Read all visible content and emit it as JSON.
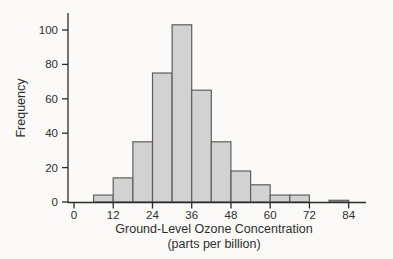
{
  "figure": {
    "background": "#fbfaf8"
  },
  "chart_data": {
    "type": "bar",
    "subtype": "histogram",
    "title": "",
    "ylabel": "Frequency",
    "xlabel": "Ground-Level Ozone Concentration",
    "xlabel_line2": "(parts per billion)",
    "bin_start": 6,
    "bin_width": 6,
    "bin_edges": [
      6,
      12,
      18,
      24,
      30,
      36,
      42,
      48,
      54,
      60,
      66,
      72,
      78,
      84
    ],
    "frequencies": [
      4,
      14,
      35,
      75,
      103,
      65,
      35,
      18,
      10,
      4,
      4,
      0,
      1
    ],
    "x_ticks": [
      0,
      12,
      24,
      36,
      48,
      60,
      72,
      84
    ],
    "y_ticks": [
      0,
      20,
      40,
      60,
      80,
      100
    ],
    "xlim": [
      0,
      90
    ],
    "ylim": [
      0,
      110
    ],
    "grid": false,
    "legend": "none",
    "bar_fill": "#d2d2d2",
    "bar_stroke": "#5e5e5e",
    "axis_color": "#2b2b2b",
    "text_color": "#2e2e2e"
  }
}
